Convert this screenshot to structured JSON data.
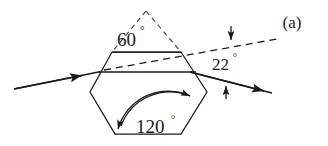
{
  "figure": {
    "panel_label": "(a)",
    "background_color": "#ffffff",
    "stroke_color": "#1a1a1a",
    "labels": {
      "apex_angle": "60",
      "apex_angle_degree_symbol": "°",
      "interior_angle": "120",
      "interior_angle_degree_symbol": "°",
      "deviation_angle": "22",
      "deviation_angle_degree_symbol": "°"
    },
    "elements": {
      "hexagon_name": "hexagonal-ice-crystal",
      "incident_ray_name": "incident-light-ray",
      "exit_ray_name": "refracted-exit-ray",
      "dashed_extension_name": "dashed-incident-extension",
      "dashed_triangle_name": "dashed-prism-apex-triangle",
      "angle_arc_120_name": "interior-angle-arc",
      "deviation_marker_top_name": "deviation-upper-tick-arrow",
      "deviation_marker_bottom_name": "deviation-lower-tick-arrow"
    }
  }
}
